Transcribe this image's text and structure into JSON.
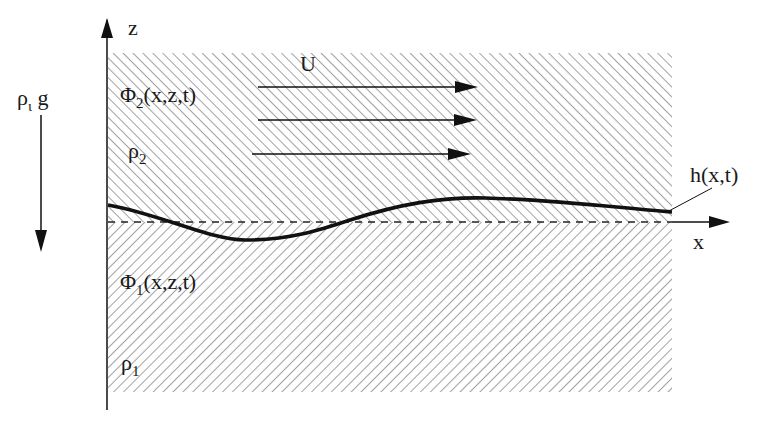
{
  "diagram": {
    "type": "two-layer fluid interface schematic",
    "axes": {
      "vertical_label": "z",
      "horizontal_label": "x"
    },
    "gravity": {
      "label_main": "ρ",
      "label_sub": "ι",
      "label_suffix": " g",
      "direction": "down"
    },
    "upper_layer": {
      "potential_main": "Φ",
      "potential_sub": "2",
      "potential_args": "(x,z,t)",
      "density_main": "ρ",
      "density_sub": "2",
      "hatch": "backslash"
    },
    "lower_layer": {
      "potential_main": "Φ",
      "potential_sub": "1",
      "potential_args": "(x,z,t)",
      "density_main": "ρ",
      "density_sub": "1",
      "hatch": "forward-slash"
    },
    "flow": {
      "label": "U",
      "arrow_count": 3,
      "direction": "right"
    },
    "interface": {
      "label": "h(x,t)",
      "style": "thick solid curve",
      "reference_line": "dashed at z=0"
    },
    "colors": {
      "hatch": "#8a8a8a",
      "lines": "#111111"
    }
  }
}
